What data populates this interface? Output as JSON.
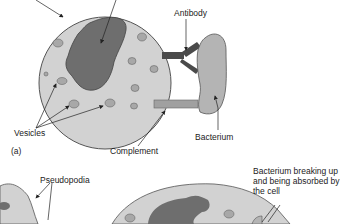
{
  "diagram": {
    "type": "phagocytosis-illustration",
    "labels": {
      "antibody": "Antibody",
      "vesicles": "Vesicles",
      "panel_a": "(a)",
      "complement": "Complement",
      "bacterium": "Bacterium",
      "pseudopodia": "Pseudopodia",
      "bacterium_breaking": "Bacterium breaking up and being absorbed by the cell"
    },
    "colors": {
      "cytoplasm": "#d2d2d2",
      "nucleus": "#6e6e6e",
      "vesicle": "#a8a8a8",
      "antibody": "#4a4a4a",
      "complement": "#a0a0a0",
      "bacterium": "#b4b4b4",
      "outline": "#555555"
    }
  }
}
